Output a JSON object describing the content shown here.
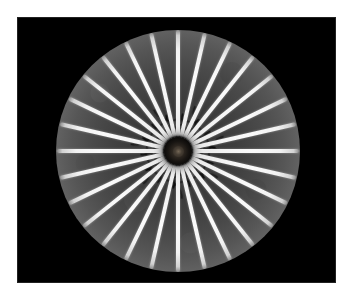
{
  "figure": {
    "kind": "grayscale-radiograph",
    "caption": "",
    "background_color": "#ffffff",
    "plate_color": "#000000"
  },
  "plate": {
    "left": 17,
    "top": 17,
    "width": 319,
    "height": 266
  },
  "disk": {
    "center_x": 178,
    "center_y": 151,
    "radius_x": 122,
    "radius_y": 121,
    "inner_gray": "#2c2c2c",
    "outer_gray": "#8e8e8e",
    "halo_color": "#bebebe"
  },
  "hub": {
    "label": "central-hub",
    "diameter": 28,
    "color": "#000000",
    "core_color": "#7a6c5a"
  },
  "spokes": {
    "count": 28,
    "color": "#fafafa",
    "bar_width": 4.2,
    "bar_length": 107,
    "inner_gap": 14,
    "angles_deg": [
      0,
      12.857,
      25.714,
      38.571,
      51.429,
      64.286,
      77.143,
      90,
      102.857,
      115.714,
      128.571,
      141.429,
      154.286,
      167.143,
      180,
      192.857,
      205.714,
      218.571,
      231.429,
      244.286,
      257.143,
      270,
      282.857,
      295.714,
      308.571,
      321.429,
      334.286,
      347.143
    ]
  },
  "hooks": {
    "count": 28,
    "color": "#000000",
    "description": "curved dark shadow arcs between inner spoke ends",
    "angles_deg": [
      6.43,
      19.29,
      32.14,
      45,
      57.86,
      70.71,
      83.57,
      96.43,
      109.29,
      122.14,
      135,
      147.86,
      160.71,
      173.57,
      186.43,
      199.29,
      212.14,
      225,
      237.86,
      250.71,
      263.57,
      276.43,
      289.29,
      302.14,
      315,
      327.86,
      340.71,
      353.57
    ]
  },
  "chart_data": {
    "type": "heatmap",
    "title": "",
    "xlabel": "",
    "ylabel": "",
    "radial_profile": {
      "r_fraction": [
        0.0,
        0.14,
        0.26,
        0.38,
        0.5,
        0.62,
        0.72,
        0.8,
        0.87,
        0.92,
        0.96,
        0.99,
        1.0
      ],
      "gray_level": [
        44,
        51,
        58,
        65,
        74,
        86,
        99,
        116,
        134,
        142,
        124,
        61,
        10
      ]
    },
    "angular_profile": {
      "description": "Intensity versus azimuth at mid-radius: periodic peaks at each spoke, troughs between.",
      "period_deg": 12.857,
      "peak_gray": 250,
      "trough_gray": 74
    },
    "grid": false,
    "legend": "none"
  }
}
